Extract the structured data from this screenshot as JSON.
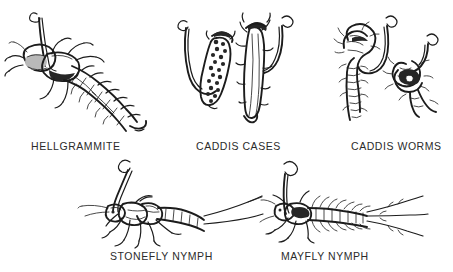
{
  "plate": {
    "background_color": "#ffffff",
    "ink_color": "#1c1c1c",
    "caption_color": "#2b2b2b",
    "title": "",
    "description": "Black and white line drawings of five live aquatic insect baits, each impaled on a fishing hook, arranged in two rows with capitalized captions beneath each drawing."
  },
  "figures": [
    {
      "id": "hellgrammite",
      "caption": "HELLGRAMMITE",
      "row": 1,
      "column": 1,
      "specimen_count": 1,
      "icon": "hellgrammite-larva-on-hook-icon",
      "notes": "Large dobsonfly larva shown in three-quarter view, broad head and pincers at left, segmented abdomen with lateral filaments trailing to lower right, hook eye projecting above the thorax."
    },
    {
      "id": "caddis-cases",
      "caption": "CADDIS CASES",
      "row": 1,
      "column": 2,
      "specimen_count": 2,
      "icon": "caddis-cases-on-hooks-icon",
      "notes": "Two cased caddis larvae hooked and hanging: left case built of fine pebbles and sand grains, right case built of twigs and plant stems."
    },
    {
      "id": "caddis-worms",
      "caption": "CADDIS WORMS",
      "row": 1,
      "column": 3,
      "specimen_count": 2,
      "icon": "caddis-worms-on-hooks-icon",
      "notes": "Two naked caddis larvae removed from their cases, segmented curled bodies with dark heads and legs, each threaded on a hook."
    },
    {
      "id": "stonefly-nymph",
      "caption": "STONEFLY NYMPH",
      "row": 2,
      "column": 1,
      "specimen_count": 1,
      "icon": "stonefly-nymph-on-hook-icon",
      "notes": "Stonefly nymph in side view facing left, two long antennae forward, six sprawling legs, segmented abdomen ending in two long cerci, hook shank rising from the thorax."
    },
    {
      "id": "mayfly-nymph",
      "caption": "MAYFLY NYMPH",
      "row": 2,
      "column": 2,
      "specimen_count": 1,
      "icon": "mayfly-nymph-on-hook-icon",
      "notes": "Mayfly nymph in top view facing left, feathery lateral gills along the abdomen, three long tail filaments to the right, hook curving up from the thorax."
    }
  ]
}
